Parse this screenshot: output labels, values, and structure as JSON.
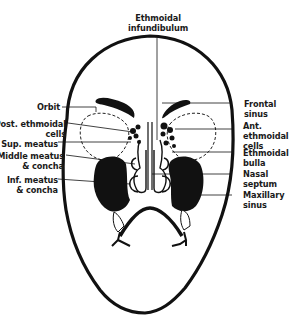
{
  "diagram": {
    "colors": {
      "ink": "#111111",
      "background": "#ffffff"
    },
    "labels": {
      "top": {
        "line1": "Ethmoidal",
        "line2": "infundibulum"
      },
      "left": [
        {
          "id": "orbit",
          "line1": "Orbit",
          "line2": ""
        },
        {
          "id": "post-ethmoidal-cells",
          "line1": "Post. ethmoidal",
          "line2": "cells"
        },
        {
          "id": "sup-meatus",
          "line1": "Sup. meatus",
          "line2": ""
        },
        {
          "id": "middle-meatus-concha",
          "line1": "Middle meatus",
          "line2": "& concha"
        },
        {
          "id": "inf-meatus-concha",
          "line1": "Inf. meatus",
          "line2": "& concha"
        }
      ],
      "right": [
        {
          "id": "frontal-sinus",
          "line1": "Frontal",
          "line2": "sinus"
        },
        {
          "id": "ant-ethmoidal-cells",
          "line1": "Ant.",
          "line2": "ethmoidal",
          "line3": "cells"
        },
        {
          "id": "ethmoidal-bulla",
          "line1": "Ethmoidal",
          "line2": "bulla"
        },
        {
          "id": "nasal-septum",
          "line1": "Nasal",
          "line2": "septum"
        },
        {
          "id": "maxillary-sinus",
          "line1": "Maxillary",
          "line2": "sinus"
        }
      ]
    }
  }
}
